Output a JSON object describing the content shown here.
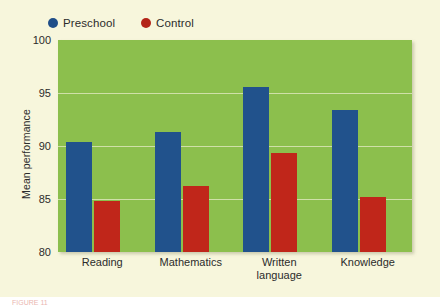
{
  "chart_data": {
    "type": "bar",
    "title": "",
    "xlabel": "",
    "ylabel": "Mean performance",
    "categories": [
      "Reading",
      "Mathematics",
      "Written\nlanguage",
      "Knowledge"
    ],
    "series": [
      {
        "name": "Preschool",
        "color": "#21528c",
        "values": [
          90.4,
          91.3,
          95.6,
          93.4
        ]
      },
      {
        "name": "Control",
        "color": "#c0261a",
        "values": [
          84.8,
          86.2,
          89.3,
          85.2
        ]
      }
    ],
    "ylim": [
      80,
      100
    ],
    "yticks": [
      80,
      85,
      90,
      95,
      100
    ],
    "ytick_labels": [
      "80",
      "85",
      "90",
      "95",
      "100"
    ],
    "grid": true,
    "legend_position": "top-left",
    "plot_background": "#8cbf4d",
    "figure_background": "#f7f6dc",
    "gridline_color": "#cfe0a8"
  },
  "legend": {
    "entries": [
      {
        "label": "Preschool",
        "color": "#21528c"
      },
      {
        "label": "Control",
        "color": "#c0261a"
      }
    ]
  },
  "caption": {
    "sliver": "FIGURE 11"
  }
}
